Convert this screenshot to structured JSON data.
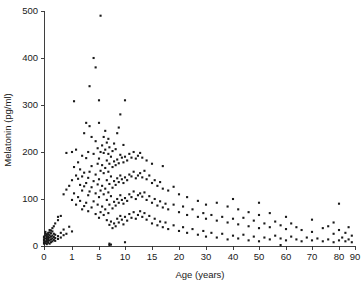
{
  "chart_data": {
    "type": "scatter",
    "title": "",
    "xlabel": "Age (years)",
    "ylabel": "Melatonin (pg/ml)",
    "xticks": [
      0,
      1,
      5,
      10,
      15,
      20,
      30,
      40,
      50,
      60,
      70,
      80,
      90
    ],
    "xticklabels": [
      "0",
      "1",
      "5",
      "10",
      "15",
      "20",
      "30",
      "40",
      "50",
      "60",
      "70",
      "80",
      "90"
    ],
    "xtick_positions_px": [
      44,
      72,
      99,
      125,
      152,
      179,
      206,
      233,
      259,
      286,
      312,
      339,
      355
    ],
    "x_axis_note": "broken/non-linear axis: 0-1-5-10-15-20 then decades",
    "yticks": [
      0,
      100,
      200,
      300,
      400,
      500
    ],
    "yticklabels": [
      "0",
      "100",
      "200",
      "300",
      "400",
      "500"
    ],
    "ylim": [
      0,
      500
    ],
    "grid": false,
    "legend": null,
    "marker": "square-dot",
    "marker_color": "#1a1a1a",
    "marker_size_px": 2.1,
    "point_count": 330,
    "points": [
      [
        0.0,
        5
      ],
      [
        0.0,
        8
      ],
      [
        0.0,
        12
      ],
      [
        0.0,
        14
      ],
      [
        0.0,
        18
      ],
      [
        0.0,
        20
      ],
      [
        0.05,
        6
      ],
      [
        0.05,
        10
      ],
      [
        0.05,
        16
      ],
      [
        0.05,
        22
      ],
      [
        0.05,
        26
      ],
      [
        0.05,
        30
      ],
      [
        0.1,
        4
      ],
      [
        0.1,
        9
      ],
      [
        0.1,
        13
      ],
      [
        0.1,
        17
      ],
      [
        0.1,
        21
      ],
      [
        0.1,
        25
      ],
      [
        0.15,
        7
      ],
      [
        0.15,
        11
      ],
      [
        0.15,
        15
      ],
      [
        0.15,
        19
      ],
      [
        0.15,
        24
      ],
      [
        0.15,
        28
      ],
      [
        0.2,
        5
      ],
      [
        0.2,
        12
      ],
      [
        0.2,
        18
      ],
      [
        0.2,
        23
      ],
      [
        0.2,
        29
      ],
      [
        0.2,
        34
      ],
      [
        0.25,
        8
      ],
      [
        0.25,
        14
      ],
      [
        0.25,
        20
      ],
      [
        0.25,
        27
      ],
      [
        0.25,
        33
      ],
      [
        0.3,
        10
      ],
      [
        0.3,
        16
      ],
      [
        0.3,
        22
      ],
      [
        0.3,
        31
      ],
      [
        0.3,
        38
      ],
      [
        0.35,
        13
      ],
      [
        0.35,
        19
      ],
      [
        0.35,
        26
      ],
      [
        0.35,
        42
      ],
      [
        0.4,
        11
      ],
      [
        0.4,
        17
      ],
      [
        0.4,
        24
      ],
      [
        0.4,
        48
      ],
      [
        0.5,
        15
      ],
      [
        0.5,
        21
      ],
      [
        0.5,
        55
      ],
      [
        0.5,
        62
      ],
      [
        0.6,
        18
      ],
      [
        0.6,
        28
      ],
      [
        0.6,
        64
      ],
      [
        0.7,
        23
      ],
      [
        0.7,
        35
      ],
      [
        0.7,
        110
      ],
      [
        0.8,
        26
      ],
      [
        0.8,
        120
      ],
      [
        0.8,
        198
      ],
      [
        0.9,
        41
      ],
      [
        0.9,
        128
      ],
      [
        1.0,
        31
      ],
      [
        1.0,
        98
      ],
      [
        1.0,
        140
      ],
      [
        1.0,
        200
      ],
      [
        1.3,
        112
      ],
      [
        1.3,
        168
      ],
      [
        1.3,
        308
      ],
      [
        1.6,
        88
      ],
      [
        1.6,
        150
      ],
      [
        1.6,
        205
      ],
      [
        1.9,
        104
      ],
      [
        1.9,
        143
      ],
      [
        1.9,
        178
      ],
      [
        2.2,
        96
      ],
      [
        2.2,
        130
      ],
      [
        2.2,
        163
      ],
      [
        2.5,
        78
      ],
      [
        2.5,
        118
      ],
      [
        2.5,
        148
      ],
      [
        2.5,
        192
      ],
      [
        2.8,
        85
      ],
      [
        2.8,
        127
      ],
      [
        2.8,
        156
      ],
      [
        2.8,
        240
      ],
      [
        3.1,
        92
      ],
      [
        3.1,
        134
      ],
      [
        3.1,
        187
      ],
      [
        3.1,
        262
      ],
      [
        3.4,
        74
      ],
      [
        3.4,
        108
      ],
      [
        3.4,
        145
      ],
      [
        3.4,
        200
      ],
      [
        3.6,
        116
      ],
      [
        3.6,
        158
      ],
      [
        3.6,
        255
      ],
      [
        3.6,
        340
      ],
      [
        3.9,
        82
      ],
      [
        3.9,
        125
      ],
      [
        3.9,
        170
      ],
      [
        3.9,
        232
      ],
      [
        4.2,
        95
      ],
      [
        4.2,
        138
      ],
      [
        4.2,
        196
      ],
      [
        4.2,
        400
      ],
      [
        4.5,
        68
      ],
      [
        4.5,
        112
      ],
      [
        4.5,
        152
      ],
      [
        4.5,
        223
      ],
      [
        4.5,
        380
      ],
      [
        4.8,
        88
      ],
      [
        4.8,
        131
      ],
      [
        4.8,
        175
      ],
      [
        4.8,
        208
      ],
      [
        5.0,
        60
      ],
      [
        5.0,
        104
      ],
      [
        5.0,
        142
      ],
      [
        5.0,
        186
      ],
      [
        5.0,
        262
      ],
      [
        5.0,
        310
      ],
      [
        5.3,
        72
      ],
      [
        5.3,
        118
      ],
      [
        5.3,
        160
      ],
      [
        5.3,
        200
      ],
      [
        5.3,
        490
      ],
      [
        5.6,
        84
      ],
      [
        5.6,
        128
      ],
      [
        5.6,
        172
      ],
      [
        5.6,
        214
      ],
      [
        5.9,
        66
      ],
      [
        5.9,
        110
      ],
      [
        5.9,
        155
      ],
      [
        5.9,
        198
      ],
      [
        5.9,
        232
      ],
      [
        6.2,
        78
      ],
      [
        6.2,
        122
      ],
      [
        6.2,
        166
      ],
      [
        6.2,
        205
      ],
      [
        6.2,
        245
      ],
      [
        6.5,
        55
      ],
      [
        6.5,
        98
      ],
      [
        6.5,
        140
      ],
      [
        6.5,
        182
      ],
      [
        6.5,
        220
      ],
      [
        6.8,
        70
      ],
      [
        6.8,
        114
      ],
      [
        6.8,
        158
      ],
      [
        6.8,
        196
      ],
      [
        6.8,
        228
      ],
      [
        7.0,
        2
      ],
      [
        7.0,
        5
      ],
      [
        7.0,
        45
      ],
      [
        7.0,
        88
      ],
      [
        7.0,
        132
      ],
      [
        7.0,
        175
      ],
      [
        7.0,
        210
      ],
      [
        7.3,
        3
      ],
      [
        7.3,
        52
      ],
      [
        7.3,
        106
      ],
      [
        7.3,
        148
      ],
      [
        7.3,
        190
      ],
      [
        7.6,
        38
      ],
      [
        7.6,
        80
      ],
      [
        7.6,
        124
      ],
      [
        7.6,
        168
      ],
      [
        7.6,
        202
      ],
      [
        7.9,
        48
      ],
      [
        7.9,
        94
      ],
      [
        7.9,
        138
      ],
      [
        7.9,
        180
      ],
      [
        7.9,
        218
      ],
      [
        8.2,
        42
      ],
      [
        8.2,
        86
      ],
      [
        8.2,
        130
      ],
      [
        8.2,
        172
      ],
      [
        8.2,
        206
      ],
      [
        8.5,
        58
      ],
      [
        8.5,
        100
      ],
      [
        8.5,
        144
      ],
      [
        8.5,
        184
      ],
      [
        8.5,
        240
      ],
      [
        8.8,
        50
      ],
      [
        8.8,
        92
      ],
      [
        8.8,
        136
      ],
      [
        8.8,
        176
      ],
      [
        8.8,
        252
      ],
      [
        9.1,
        64
      ],
      [
        9.1,
        108
      ],
      [
        9.1,
        150
      ],
      [
        9.1,
        194
      ],
      [
        9.1,
        280
      ],
      [
        9.4,
        56
      ],
      [
        9.4,
        98
      ],
      [
        9.4,
        142
      ],
      [
        9.4,
        188
      ],
      [
        9.7,
        46
      ],
      [
        9.7,
        90
      ],
      [
        9.7,
        134
      ],
      [
        9.7,
        178
      ],
      [
        9.7,
        215
      ],
      [
        10.0,
        8
      ],
      [
        10.0,
        62
      ],
      [
        10.0,
        102
      ],
      [
        10.0,
        146
      ],
      [
        10.0,
        190
      ],
      [
        10.0,
        310
      ],
      [
        10.4,
        54
      ],
      [
        10.4,
        96
      ],
      [
        10.4,
        140
      ],
      [
        10.4,
        182
      ],
      [
        10.8,
        68
      ],
      [
        10.8,
        110
      ],
      [
        10.8,
        152
      ],
      [
        10.8,
        196
      ],
      [
        11.2,
        60
      ],
      [
        11.2,
        104
      ],
      [
        11.2,
        148
      ],
      [
        11.2,
        188
      ],
      [
        11.6,
        72
      ],
      [
        11.6,
        116
      ],
      [
        11.6,
        158
      ],
      [
        11.6,
        200
      ],
      [
        12.0,
        58
      ],
      [
        12.0,
        100
      ],
      [
        12.0,
        144
      ],
      [
        12.0,
        186
      ],
      [
        12.4,
        66
      ],
      [
        12.4,
        108
      ],
      [
        12.4,
        150
      ],
      [
        12.4,
        192
      ],
      [
        12.8,
        74
      ],
      [
        12.8,
        112
      ],
      [
        12.8,
        155
      ],
      [
        12.8,
        198
      ],
      [
        13.2,
        62
      ],
      [
        13.2,
        105
      ],
      [
        13.2,
        146
      ],
      [
        13.2,
        188
      ],
      [
        13.6,
        70
      ],
      [
        13.6,
        114
      ],
      [
        13.6,
        160
      ],
      [
        14.0,
        56
      ],
      [
        14.0,
        98
      ],
      [
        14.0,
        142
      ],
      [
        14.0,
        182
      ],
      [
        14.5,
        64
      ],
      [
        14.5,
        106
      ],
      [
        14.5,
        150
      ],
      [
        15.0,
        48
      ],
      [
        15.0,
        92
      ],
      [
        15.0,
        134
      ],
      [
        15.0,
        175
      ],
      [
        15.5,
        58
      ],
      [
        15.5,
        100
      ],
      [
        15.5,
        140
      ],
      [
        16.0,
        44
      ],
      [
        16.0,
        86
      ],
      [
        16.0,
        128
      ],
      [
        16.5,
        52
      ],
      [
        16.5,
        95
      ],
      [
        16.5,
        136
      ],
      [
        17.0,
        40
      ],
      [
        17.0,
        82
      ],
      [
        17.0,
        122
      ],
      [
        17.0,
        170
      ],
      [
        17.5,
        50
      ],
      [
        17.5,
        90
      ],
      [
        18.0,
        36
      ],
      [
        18.0,
        78
      ],
      [
        18.0,
        118
      ],
      [
        19.0,
        44
      ],
      [
        19.0,
        88
      ],
      [
        19.0,
        126
      ],
      [
        20.0,
        32
      ],
      [
        20.0,
        72
      ],
      [
        20.0,
        110
      ],
      [
        21.5,
        40
      ],
      [
        21.5,
        84
      ],
      [
        23.0,
        28
      ],
      [
        23.0,
        66
      ],
      [
        23.0,
        104
      ],
      [
        25.0,
        36
      ],
      [
        25.0,
        78
      ],
      [
        27.0,
        24
      ],
      [
        27.0,
        62
      ],
      [
        27.0,
        96
      ],
      [
        29.0,
        32
      ],
      [
        29.0,
        70
      ],
      [
        30.0,
        20
      ],
      [
        30.0,
        58
      ],
      [
        30.0,
        88
      ],
      [
        32.0,
        28
      ],
      [
        32.0,
        66
      ],
      [
        34.0,
        18
      ],
      [
        34.0,
        54
      ],
      [
        34.0,
        92
      ],
      [
        36.0,
        26
      ],
      [
        36.0,
        62
      ],
      [
        38.0,
        14
      ],
      [
        38.0,
        50
      ],
      [
        38.0,
        84
      ],
      [
        40.0,
        22
      ],
      [
        40.0,
        58
      ],
      [
        40.0,
        100
      ],
      [
        42.0,
        16
      ],
      [
        42.0,
        46
      ],
      [
        42.0,
        78
      ],
      [
        44.0,
        24
      ],
      [
        44.0,
        60
      ],
      [
        46.0,
        12
      ],
      [
        46.0,
        42
      ],
      [
        46.0,
        72
      ],
      [
        48.0,
        20
      ],
      [
        48.0,
        54
      ],
      [
        50.0,
        10
      ],
      [
        50.0,
        38
      ],
      [
        50.0,
        66
      ],
      [
        50.0,
        92
      ],
      [
        52.0,
        18
      ],
      [
        52.0,
        48
      ],
      [
        54.0,
        14
      ],
      [
        54.0,
        40
      ],
      [
        54.0,
        70
      ],
      [
        56.0,
        22
      ],
      [
        56.0,
        52
      ],
      [
        58.0,
        2
      ],
      [
        58.0,
        16
      ],
      [
        58.0,
        44
      ],
      [
        60.0,
        12
      ],
      [
        60.0,
        36
      ],
      [
        60.0,
        62
      ],
      [
        62.0,
        20
      ],
      [
        62.0,
        48
      ],
      [
        64.0,
        14
      ],
      [
        64.0,
        40
      ],
      [
        66.0,
        10
      ],
      [
        66.0,
        34
      ],
      [
        68.0,
        18
      ],
      [
        70.0,
        12
      ],
      [
        70.0,
        30
      ],
      [
        70.0,
        56
      ],
      [
        72.0,
        16
      ],
      [
        74.0,
        10
      ],
      [
        74.0,
        38
      ],
      [
        76.0,
        14
      ],
      [
        76.0,
        42
      ],
      [
        78.0,
        8
      ],
      [
        78.0,
        26
      ],
      [
        78.0,
        50
      ],
      [
        80.0,
        12
      ],
      [
        80.0,
        34
      ],
      [
        80.0,
        90
      ],
      [
        82.0,
        18
      ],
      [
        84.0,
        10
      ],
      [
        84.0,
        28
      ],
      [
        86.0,
        14
      ],
      [
        86.0,
        40
      ],
      [
        88.0,
        8
      ],
      [
        88.0,
        22
      ]
    ]
  }
}
